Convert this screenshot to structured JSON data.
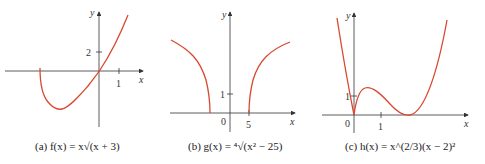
{
  "figure": {
    "panels": [
      {
        "id": "a",
        "caption": "(a) f(x) = x√(x + 3)",
        "tick_labels": {
          "y": "2",
          "x": "1"
        },
        "axis_labels": {
          "x": "x",
          "y": "y"
        }
      },
      {
        "id": "b",
        "caption": "(b) g(x) = ⁴√(x² − 25)",
        "tick_labels": {
          "y": "1",
          "x": "5",
          "origin": "0"
        },
        "axis_labels": {
          "x": "x",
          "y": "y"
        }
      },
      {
        "id": "c",
        "caption": "(c) h(x) = x^(2/3)(x − 2)²",
        "tick_labels": {
          "y": "1",
          "x": "1",
          "origin": "0"
        },
        "axis_labels": {
          "x": "x",
          "y": "y"
        }
      }
    ],
    "curve_color": "#d9482f",
    "axis_color": "#333333"
  }
}
